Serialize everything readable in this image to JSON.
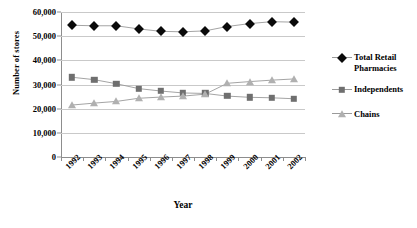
{
  "chart_data": {
    "type": "line",
    "title": "",
    "xlabel": "Year",
    "ylabel": "Number of stores",
    "x": [
      1992,
      1993,
      1994,
      1995,
      1996,
      1997,
      1998,
      1999,
      2000,
      2001,
      2002
    ],
    "categories": [
      "1992",
      "1993",
      "1994",
      "1995",
      "1996",
      "1997",
      "1998",
      "1999",
      "2000",
      "2001",
      "2002"
    ],
    "ylim": [
      0,
      60000
    ],
    "yticks": [
      0,
      10000,
      20000,
      30000,
      40000,
      50000,
      60000
    ],
    "ytick_labels": [
      "0",
      "10,000",
      "20,000",
      "30,000",
      "40,000",
      "50,000",
      "60,000"
    ],
    "grid": "horizontal",
    "legend_position": "right",
    "series": [
      {
        "name": "Total Retail Pharmacies",
        "marker": "diamond",
        "color": "#0a0a0a",
        "values": [
          54500,
          54300,
          54300,
          53000,
          52000,
          51800,
          52200,
          54000,
          55200,
          56000,
          55800
        ]
      },
      {
        "name": "Independents",
        "marker": "square",
        "color": "#6f6f6f",
        "values": [
          33000,
          32000,
          30300,
          28300,
          27300,
          26500,
          26300,
          25200,
          24700,
          24500,
          24100
        ]
      },
      {
        "name": "Chains",
        "marker": "triangle",
        "color": "#b0b0b0",
        "values": [
          21500,
          22300,
          23000,
          24300,
          24800,
          25200,
          26000,
          30500,
          31200,
          31800,
          32300
        ]
      }
    ]
  },
  "legend": {
    "items": [
      {
        "label": "Total Retail Pharmacies",
        "marker": "diamond"
      },
      {
        "label": "Independents",
        "marker": "square"
      },
      {
        "label": "Chains",
        "marker": "triangle"
      }
    ]
  },
  "axes": {
    "y_title": "Number of stores",
    "x_title": "Year"
  }
}
